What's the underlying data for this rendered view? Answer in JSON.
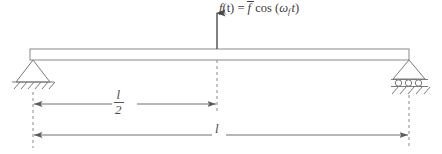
{
  "figure": {
    "background_color": "#ffffff",
    "line_color": "#6e6e6e",
    "text_color": "#4a4a4a"
  },
  "force": {
    "equation_plain": "f(t) = f̄ cos (ω_f t)",
    "lhs_function": "f",
    "lhs_argument": "(t)",
    "equals": "=",
    "amplitude": "f",
    "cosine": "cos",
    "open_paren": "(",
    "omega": "ω",
    "omega_subscript": "f",
    "time": "t",
    "close_paren": ")",
    "direction": "up",
    "location": "midspan"
  },
  "beam": {
    "shape": "rectangle",
    "left_x": 30,
    "right_x": 409,
    "top_y": 49,
    "bottom_y": 60
  },
  "supports": {
    "left": {
      "type": "pinned",
      "name": "pin-support",
      "x": 33,
      "hatch_count": 6
    },
    "right": {
      "type": "roller",
      "name": "roller-support",
      "x": 409,
      "roller_count": 3,
      "hatch_count": 5
    }
  },
  "dimensions": [
    {
      "id": "half-span",
      "label_numerator": "l",
      "label_denominator": "2",
      "label_plain": "l/2",
      "from_x": 33,
      "to_x": 217,
      "y": 104,
      "arrow_start": true,
      "arrow_end": true
    },
    {
      "id": "full-span",
      "label_plain": "l",
      "label": "l",
      "from_x": 33,
      "to_x": 409,
      "y": 135,
      "arrow_start": true,
      "arrow_end": true
    }
  ],
  "extension_lines": [
    {
      "id": "left-extension",
      "x": 33,
      "top_y": 80,
      "bottom_y": 148
    },
    {
      "id": "center-extension",
      "x": 217,
      "top_y": 60,
      "bottom_y": 112
    },
    {
      "id": "right-extension",
      "x": 409,
      "top_y": 90,
      "bottom_y": 148
    }
  ]
}
